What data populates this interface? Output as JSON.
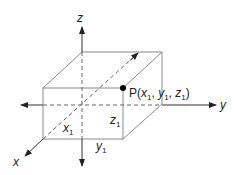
{
  "diagram": {
    "type": "3d-coordinate-box",
    "axes": {
      "x_label": "x",
      "y_label": "y",
      "z_label": "z"
    },
    "point": {
      "label_prefix": "P(",
      "x": "x",
      "x_sub": "1",
      "y": "y",
      "y_sub": "1",
      "z": "z",
      "z_sub": "1",
      "label_suffix": ")",
      "sep": ", "
    },
    "dimensions": {
      "x1": {
        "base": "x",
        "sub": "1"
      },
      "y1": {
        "base": "y",
        "sub": "1"
      },
      "z1": {
        "base": "z",
        "sub": "1"
      }
    },
    "colors": {
      "line": "#888888",
      "axis": "#333333",
      "point": "#000000"
    }
  }
}
